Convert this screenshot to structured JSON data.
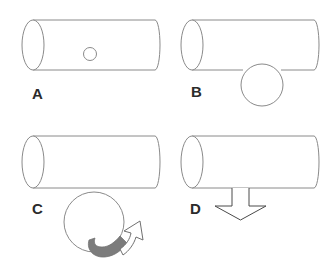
{
  "figure": {
    "background_color": "#ffffff",
    "width": 326,
    "height": 268,
    "outline_color": "#8a8a8a",
    "arrow_gray_fill": "#7c7c7c",
    "label_color": "#2b2b2b"
  },
  "panels": [
    {
      "id": "A",
      "label": "A",
      "position": "top-left",
      "description": "Cylinder with a small circular hole on its side",
      "cylinder": {
        "left_cap_center_x": 33,
        "left_cap_center_y": 45,
        "cap_rx": 11,
        "cap_ry": 25,
        "body_left_x": 33,
        "body_right_x": 155,
        "top_y": 20,
        "bottom_y": 70
      },
      "marker": {
        "type": "small-circle",
        "cx": 90,
        "cy": 54,
        "r": 6
      }
    },
    {
      "id": "B",
      "label": "B",
      "position": "top-right",
      "description": "Cylinder with a large circle overlapping its lower edge",
      "cylinder": {
        "left_cap_center_x": 192,
        "left_cap_center_y": 45,
        "cap_rx": 11,
        "cap_ry": 25,
        "body_left_x": 192,
        "body_right_x": 314,
        "top_y": 20,
        "bottom_y": 70
      },
      "marker": {
        "type": "large-circle",
        "cx": 262,
        "cy": 85,
        "r": 21
      }
    },
    {
      "id": "C",
      "label": "C",
      "position": "bottom-left",
      "description": "Cylinder with a large circle below it and a curved rotation arrow",
      "cylinder": {
        "left_cap_center_x": 33,
        "left_cap_center_y": 162,
        "cap_rx": 11,
        "cap_ry": 26,
        "body_left_x": 33,
        "body_right_x": 155,
        "top_y": 136,
        "bottom_y": 188
      },
      "marker": {
        "type": "circle-with-curved-arrow",
        "cx": 94,
        "cy": 222,
        "r": 30,
        "arrow_fill": "#7c7c7c",
        "arrowhead_fill": "#ffffff"
      }
    },
    {
      "id": "D",
      "label": "D",
      "position": "bottom-right",
      "description": "Cylinder with a downward pointing outline arrow beneath it",
      "cylinder": {
        "left_cap_center_x": 192,
        "left_cap_center_y": 162,
        "cap_rx": 11,
        "cap_ry": 26,
        "body_left_x": 192,
        "body_right_x": 314,
        "top_y": 136,
        "bottom_y": 188
      },
      "marker": {
        "type": "down-arrow",
        "shaft_left_x": 232,
        "shaft_right_x": 249,
        "shaft_top_y": 188,
        "shaft_bottom_y": 206,
        "head_left_x": 215,
        "head_right_x": 266,
        "head_tip_y": 220
      }
    }
  ]
}
